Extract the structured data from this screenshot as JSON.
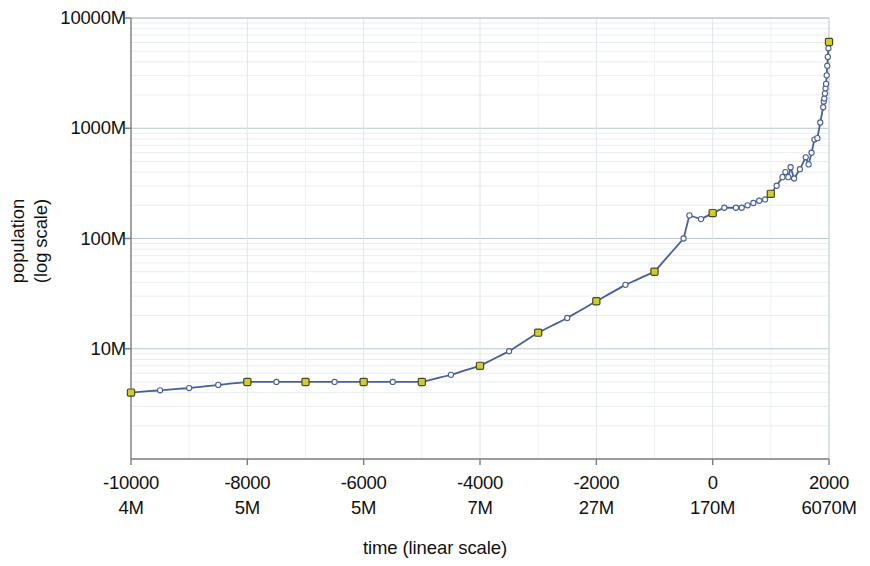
{
  "chart_data": {
    "type": "line",
    "title": "",
    "xlabel": "time (linear scale)",
    "ylabel": "population\n(log scale)",
    "yscale": "log",
    "xscale": "linear",
    "xlim": [
      -10000,
      2000
    ],
    "ylim": [
      1000000,
      10000000000
    ],
    "grid": true,
    "legend": false,
    "y_ticks": [
      {
        "value": 10000000000,
        "label": "10000M"
      },
      {
        "value": 1000000000,
        "label": "1000M"
      },
      {
        "value": 100000000,
        "label": "100M"
      },
      {
        "value": 10000000,
        "label": "10M"
      }
    ],
    "x_ticks": [
      {
        "value": -10000,
        "year_label": "-10000",
        "pop_label": "4M"
      },
      {
        "value": -8000,
        "year_label": "-8000",
        "pop_label": "5M"
      },
      {
        "value": -6000,
        "year_label": "-6000",
        "pop_label": "5M"
      },
      {
        "value": -4000,
        "year_label": "-4000",
        "pop_label": "7M"
      },
      {
        "value": -2000,
        "year_label": "-2000",
        "pop_label": "27M"
      },
      {
        "value": 0,
        "year_label": "0",
        "pop_label": "170M"
      },
      {
        "value": 2000,
        "year_label": "2000",
        "pop_label": "6070M"
      }
    ],
    "series": [
      {
        "name": "world population",
        "line_color": "#4a5f96",
        "marker_color": "#ffffff",
        "marker_edge_color": "#4a5f96",
        "highlight_marker_color": "#cccc33",
        "highlight_marker_edge_color": "#4a4a20",
        "x": [
          -10000,
          -9500,
          -9000,
          -8500,
          -8000,
          -7500,
          -7000,
          -6500,
          -6000,
          -5500,
          -5000,
          -4500,
          -4000,
          -3500,
          -3000,
          -2500,
          -2000,
          -1500,
          -1000,
          -500,
          -400,
          -200,
          0,
          200,
          400,
          500,
          600,
          700,
          800,
          900,
          1000,
          1100,
          1200,
          1250,
          1300,
          1340,
          1400,
          1500,
          1600,
          1650,
          1700,
          1750,
          1800,
          1850,
          1900,
          1910,
          1920,
          1930,
          1940,
          1950,
          1960,
          1970,
          1980,
          1990,
          2000
        ],
        "y": [
          4000000,
          4200000,
          4400000,
          4700000,
          5000000,
          5000000,
          5000000,
          5000000,
          5000000,
          5000000,
          5000000,
          5800000,
          7000000,
          9500000,
          14000000,
          19000000,
          27000000,
          38000000,
          50000000,
          100000000,
          162000000,
          150000000,
          170000000,
          190000000,
          190000000,
          190000000,
          200000000,
          210000000,
          220000000,
          226000000,
          254000000,
          301000000,
          360000000,
          400000000,
          360000000,
          443000000,
          350000000,
          425000000,
          545000000,
          470000000,
          600000000,
          790000000,
          813000000,
          1128000000,
          1550000000,
          1750000000,
          1860000000,
          2070000000,
          2300000000,
          2525000000,
          3018000000,
          3682000000,
          4440000000,
          5310000000,
          6070000000
        ],
        "highlight_points": [
          {
            "x": -10000,
            "y": 4000000
          },
          {
            "x": -8000,
            "y": 5000000
          },
          {
            "x": -7000,
            "y": 5000000
          },
          {
            "x": -6000,
            "y": 5000000
          },
          {
            "x": -5000,
            "y": 5000000
          },
          {
            "x": -4000,
            "y": 7000000
          },
          {
            "x": -3000,
            "y": 14000000
          },
          {
            "x": -2000,
            "y": 27000000
          },
          {
            "x": -1000,
            "y": 50000000
          },
          {
            "x": 0,
            "y": 170000000
          },
          {
            "x": 1000,
            "y": 254000000
          },
          {
            "x": 2000,
            "y": 6070000000
          }
        ]
      }
    ]
  },
  "axes": {
    "x_title": "time (linear scale)",
    "y_title_line1": "population",
    "y_title_line2": "(log scale)"
  }
}
